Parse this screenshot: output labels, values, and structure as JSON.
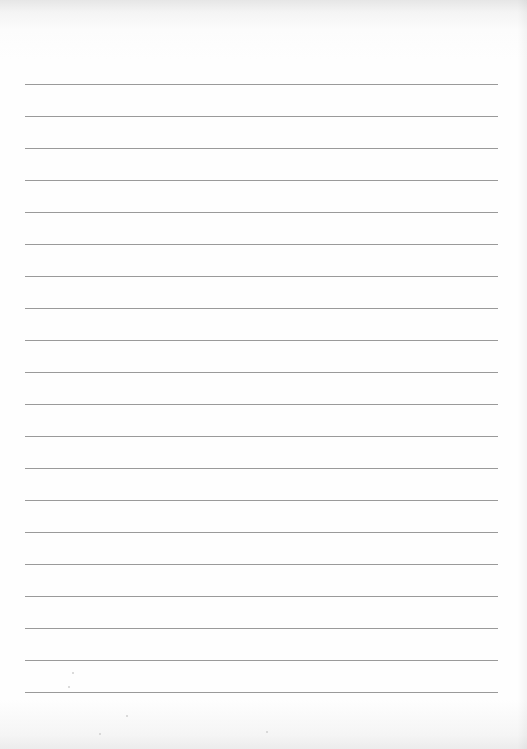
{
  "document": {
    "type": "blank-lined-paper",
    "line_count": 20,
    "first_line_y": 84,
    "line_spacing_px": 32,
    "line_left_x": 25,
    "line_right_x": 498,
    "line_color": "#9a9a9a",
    "paper_color": "#fefefe",
    "text_content": ""
  }
}
